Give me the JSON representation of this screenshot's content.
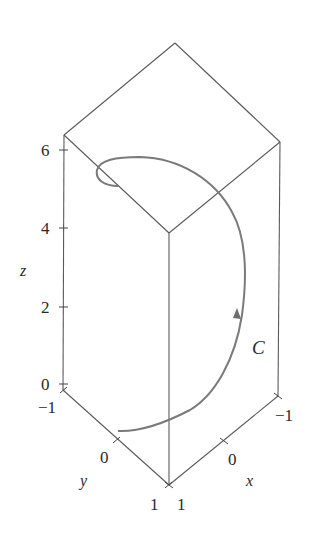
{
  "figure": {
    "curve_label": "C",
    "axes": {
      "z": {
        "label": "z",
        "ticks": [
          "0",
          "2",
          "4",
          "6"
        ]
      },
      "y": {
        "label": "y",
        "ticks": [
          "−1",
          "0",
          "1"
        ]
      },
      "x": {
        "label": "x",
        "ticks": [
          "1",
          "0",
          "−1"
        ]
      }
    },
    "colors": {
      "box_line": "#555555",
      "curve": "#7a7a7a",
      "text": "#2a2a2a"
    }
  }
}
